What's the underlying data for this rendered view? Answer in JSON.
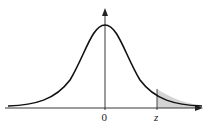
{
  "diagram": {
    "type": "normal-distribution-curve",
    "axis_labels": {
      "origin": "0",
      "z": "z"
    },
    "shaded_region": "right tail beyond z",
    "colors": {
      "curve": "#111111",
      "axis": "#222222",
      "shade": "#d4d4d4"
    }
  }
}
